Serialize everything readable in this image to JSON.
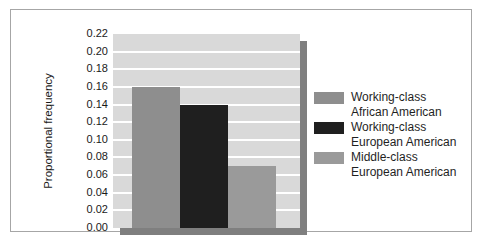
{
  "figure": {
    "background_color": "#ffffff",
    "frame_border_color": "#a6a6a6"
  },
  "chart_data": {
    "type": "bar",
    "title": "",
    "xlabel": "",
    "ylabel": "Proportional frequency",
    "categories": [
      "Working-class African American",
      "Working-class European American",
      "Middle-class European American"
    ],
    "values": [
      0.16,
      0.14,
      0.07
    ],
    "ylim": [
      0,
      0.22
    ],
    "ytick_interval": 0.02,
    "yticks": [
      "0.22",
      "0.20",
      "0.18",
      "0.16",
      "0.14",
      "0.12",
      "0.10",
      "0.08",
      "0.06",
      "0.04",
      "0.02",
      "0.00"
    ],
    "grid": "horizontal white gridlines on light-gray plot background",
    "legend_position": "right",
    "bar_colors": [
      "#8e8e8e",
      "#1f1f1f",
      "#9a9a9a"
    ],
    "plot_background_color": "#d9d9d9",
    "gridline_color": "#ffffff",
    "shadow_color": "#7f7f7f"
  },
  "legend": {
    "entries": [
      {
        "color": "#8e8e8e",
        "line1": "Working-class",
        "line2": "African American"
      },
      {
        "color": "#1f1f1f",
        "line1": "Working-class",
        "line2": "European American"
      },
      {
        "color": "#9a9a9a",
        "line1": "Middle-class",
        "line2": "European American"
      }
    ]
  }
}
